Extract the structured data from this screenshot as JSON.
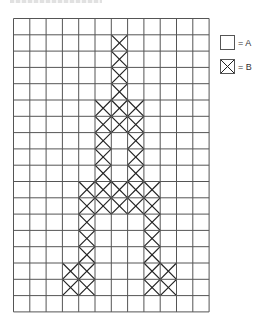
{
  "figure": {
    "grid": {
      "columns": 12,
      "rows": 18,
      "cell_size": 16.3,
      "line_color": "#555555",
      "mark_color": "#222222",
      "b_cells": [
        [
          1,
          6
        ],
        [
          2,
          6
        ],
        [
          3,
          6
        ],
        [
          4,
          6
        ],
        [
          5,
          5
        ],
        [
          5,
          6
        ],
        [
          5,
          7
        ],
        [
          6,
          5
        ],
        [
          6,
          6
        ],
        [
          6,
          7
        ],
        [
          7,
          5
        ],
        [
          7,
          7
        ],
        [
          8,
          5
        ],
        [
          8,
          7
        ],
        [
          9,
          5
        ],
        [
          9,
          7
        ],
        [
          10,
          4
        ],
        [
          10,
          5
        ],
        [
          10,
          6
        ],
        [
          10,
          7
        ],
        [
          10,
          8
        ],
        [
          11,
          4
        ],
        [
          11,
          5
        ],
        [
          11,
          6
        ],
        [
          11,
          7
        ],
        [
          11,
          8
        ],
        [
          12,
          4
        ],
        [
          12,
          8
        ],
        [
          13,
          4
        ],
        [
          13,
          8
        ],
        [
          14,
          4
        ],
        [
          14,
          8
        ],
        [
          15,
          3
        ],
        [
          15,
          4
        ],
        [
          15,
          8
        ],
        [
          15,
          9
        ],
        [
          16,
          3
        ],
        [
          16,
          4
        ],
        [
          16,
          8
        ],
        [
          16,
          9
        ]
      ]
    },
    "legend": [
      {
        "symbol": "empty-square",
        "label": "= A"
      },
      {
        "symbol": "crossed-square",
        "label": "= B"
      }
    ]
  }
}
